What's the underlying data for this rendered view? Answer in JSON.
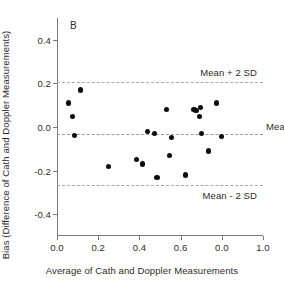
{
  "panel": {
    "label": "B"
  },
  "chart_data": {
    "type": "scatter",
    "title": "",
    "xlabel": "Average of Cath and Doppler Measurements",
    "ylabel": "Bias (Difference of Cath and Doppler Measurements)",
    "xlim": [
      0.0,
      1.0
    ],
    "ylim": [
      -0.5,
      0.5
    ],
    "grid": false,
    "legend": "none",
    "xticks": [
      0.0,
      0.2,
      0.4,
      0.6,
      0.8,
      1.0
    ],
    "xtick_labels": [
      "0.0",
      "0.2",
      "0.4",
      "0.6",
      "0.0",
      "1.0"
    ],
    "yticks": [
      0.4,
      0.2,
      0.0,
      -0.2,
      -0.4
    ],
    "ytick_labels": [
      "0.4",
      "0.2",
      "0.0",
      "-0.2",
      "-0.4"
    ],
    "reference_lines": [
      {
        "name": "upper-limit-of-agreement",
        "label": "Mean + 2 SD",
        "value": 0.205,
        "style": "dashed"
      },
      {
        "name": "mean-bias",
        "label": "Mean",
        "value": -0.03,
        "style": "dashed"
      },
      {
        "name": "lower-limit-of-agreement",
        "label": "Mean - 2 SD",
        "value": -0.265,
        "style": "dashed"
      }
    ],
    "points": [
      {
        "x": 0.055,
        "y": 0.11
      },
      {
        "x": 0.075,
        "y": 0.05
      },
      {
        "x": 0.085,
        "y": -0.04
      },
      {
        "x": 0.115,
        "y": 0.17
      },
      {
        "x": 0.25,
        "y": -0.18
      },
      {
        "x": 0.385,
        "y": -0.15
      },
      {
        "x": 0.415,
        "y": -0.17
      },
      {
        "x": 0.44,
        "y": -0.02
      },
      {
        "x": 0.475,
        "y": -0.03
      },
      {
        "x": 0.485,
        "y": -0.23
      },
      {
        "x": 0.53,
        "y": 0.08
      },
      {
        "x": 0.545,
        "y": -0.13
      },
      {
        "x": 0.555,
        "y": -0.05
      },
      {
        "x": 0.625,
        "y": -0.22
      },
      {
        "x": 0.665,
        "y": 0.08
      },
      {
        "x": 0.675,
        "y": 0.075
      },
      {
        "x": 0.69,
        "y": 0.05
      },
      {
        "x": 0.695,
        "y": 0.09
      },
      {
        "x": 0.7,
        "y": -0.03
      },
      {
        "x": 0.735,
        "y": -0.11
      },
      {
        "x": 0.775,
        "y": 0.11
      },
      {
        "x": 0.8,
        "y": -0.045
      }
    ]
  }
}
